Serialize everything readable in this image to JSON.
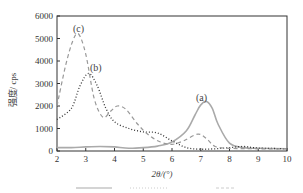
{
  "chart_data": {
    "type": "line",
    "title": "",
    "xlabel": "2θ/(°)",
    "ylabel": "强度/ cps",
    "xlim": [
      2,
      10
    ],
    "ylim": [
      0,
      6000
    ],
    "x_ticks": [
      "2",
      "3",
      "4",
      "5",
      "6",
      "7",
      "8",
      "9",
      "10"
    ],
    "y_ticks": [
      "0",
      "1000",
      "2000",
      "3000",
      "4000",
      "5000",
      "6000"
    ],
    "grid": false,
    "legend": {
      "position": "below",
      "entries": [
        "solid",
        "dotted",
        "dashed"
      ]
    },
    "series": [
      {
        "name": "(a)",
        "style": "solid",
        "color": "#aaaaaa",
        "x": [
          2,
          2.5,
          3,
          3.5,
          4,
          4.5,
          5,
          5.5,
          6,
          6.5,
          6.8,
          7.0,
          7.2,
          7.4,
          7.6,
          8,
          8.5,
          9,
          10
        ],
        "y": [
          150,
          150,
          180,
          200,
          180,
          120,
          150,
          220,
          400,
          900,
          1600,
          2050,
          2200,
          1900,
          1200,
          350,
          150,
          120,
          100
        ]
      },
      {
        "name": "(b)",
        "style": "dotted",
        "color": "#333333",
        "x": [
          2,
          2.5,
          2.8,
          3.1,
          3.4,
          3.7,
          4,
          4.5,
          5,
          5.5,
          6,
          6.5,
          7,
          7.5,
          8,
          8.5,
          9,
          10
        ],
        "y": [
          1400,
          1900,
          2900,
          3450,
          2900,
          1900,
          1300,
          1000,
          850,
          800,
          450,
          150,
          80,
          100,
          150,
          200,
          130,
          100
        ]
      },
      {
        "name": "(c)",
        "style": "dashed",
        "color": "#999999",
        "x": [
          2,
          2.3,
          2.55,
          2.75,
          3,
          3.3,
          3.6,
          3.85,
          4.1,
          4.4,
          4.8,
          5.2,
          5.6,
          6,
          6.4,
          6.9,
          7.2,
          7.5,
          8,
          9,
          10
        ],
        "y": [
          2000,
          3800,
          4900,
          5200,
          4300,
          2300,
          1500,
          1750,
          2000,
          1850,
          1200,
          700,
          400,
          300,
          450,
          750,
          550,
          200,
          120,
          100,
          100
        ]
      }
    ],
    "annotations": [
      {
        "text": "(c)",
        "x": 2.75,
        "y": 5450
      },
      {
        "text": "(b)",
        "x": 3.3,
        "y": 3750
      },
      {
        "text": "(a)",
        "x": 7.2,
        "y": 2450
      }
    ]
  },
  "labels": {
    "xlabel": "2θ/(°)",
    "ylabel": "强度/ cps",
    "ann_a": "(a)",
    "ann_b": "(b)",
    "ann_c": "(c)"
  }
}
